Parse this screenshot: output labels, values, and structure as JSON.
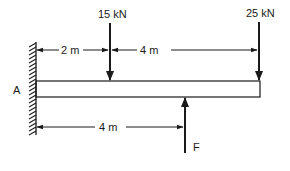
{
  "diagram": {
    "type": "cantilever-beam",
    "support": {
      "label": "A",
      "kind": "fixed-wall"
    },
    "loads": [
      {
        "name": "load-15kn",
        "label": "15 kN",
        "direction": "down",
        "position_m": 2
      },
      {
        "name": "load-25kn",
        "label": "25 kN",
        "direction": "down",
        "position_m": 6
      }
    ],
    "reaction": {
      "label": "F",
      "direction": "up",
      "position_m": 4
    },
    "dimensions": {
      "top": [
        {
          "label": "2 m",
          "from_m": 0,
          "to_m": 2
        },
        {
          "label": "4 m",
          "from_m": 2,
          "to_m": 6
        }
      ],
      "bottom": [
        {
          "label": "4 m",
          "from_m": 0,
          "to_m": 4
        }
      ]
    },
    "colors": {
      "line": "#1a1a1a",
      "background": "#ffffff"
    }
  }
}
